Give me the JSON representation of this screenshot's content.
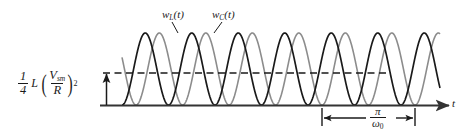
{
  "figure": {
    "name": "energy-in-inductor-and-capacitor-vs-time",
    "axis_label_x": "t",
    "level_label": {
      "coefficient_num": "1",
      "coefficient_den": "4",
      "inductance": "L",
      "ratio_num": "V",
      "ratio_num_sub": "sm",
      "ratio_den": "R",
      "exponent": "2"
    },
    "curve_labels": [
      {
        "id": "wl",
        "base": "w",
        "sub": "L",
        "arg": "(t)",
        "color": "#1a1a1a"
      },
      {
        "id": "wc",
        "base": "w",
        "sub": "C",
        "arg": "(t)",
        "color": "#8c8c8c"
      }
    ],
    "period_label": {
      "num": "π",
      "den": "ω",
      "den_sub": "0"
    },
    "colors": {
      "axis": "#333333",
      "curve_inductor": "#1a1a1a",
      "curve_capacitor": "#8c8c8c",
      "dashed_level": "#1a1a1a",
      "background": "#ffffff"
    }
  },
  "chart_data": {
    "type": "line",
    "title": "",
    "xlabel": "t",
    "ylabel": "",
    "grid": false,
    "legend": "inline-annotations",
    "annotations": [
      {
        "text": "w_L(t)",
        "target": "black-curve-peak"
      },
      {
        "text": "w_C(t)",
        "target": "gray-curve-peak"
      },
      {
        "text": "π/ω₀",
        "target": "period-span"
      },
      {
        "text": "(1/4)L(V_sm/R)^2",
        "target": "half-peak-level"
      }
    ],
    "series": [
      {
        "name": "w_L(t)",
        "color": "#1a1a1a",
        "formula": "A*sin^2(w0*t)",
        "description": "Energy stored in inductor, squared-sine lobes from baseline to peak"
      },
      {
        "name": "w_C(t)",
        "color": "#8c8c8c",
        "formula": "A*cos^2(w0*t)",
        "description": "Energy stored in capacitor, squared-cosine lobes, interleaved with w_L"
      }
    ],
    "reference_lines": [
      {
        "name": "half-peak-dashed-level",
        "orientation": "horizontal",
        "value_label": "(1/4)L(V_sm/R)^2",
        "style": "dashed"
      }
    ],
    "x_axis": {
      "baseline": true,
      "arrow": true,
      "ticks": false
    },
    "y_axis": {
      "visible": false
    },
    "period_span": {
      "label": "π/ω₀",
      "meaning": "half period of sin^2 lobe"
    },
    "lobe_count_visible": 8
  }
}
